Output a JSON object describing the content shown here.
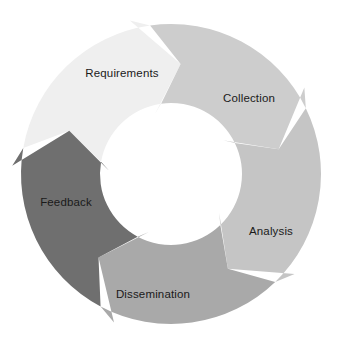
{
  "diagram": {
    "type": "cycle",
    "direction": "clockwise",
    "background_color": "#ffffff",
    "label_color": "#1a1a1a",
    "geometry": {
      "center_x": 171,
      "center_y": 174,
      "outer_radius": 150,
      "inner_radius": 71
    },
    "segments": [
      {
        "id": "requirements",
        "label": "Requirements",
        "color": "#efefef",
        "start_angle": -80,
        "end_angle": -8,
        "label_x": 122,
        "label_y": 74,
        "anchor": "middle"
      },
      {
        "id": "collection",
        "label": "Collection",
        "color": "#cdcdcd",
        "start_angle": -8,
        "end_angle": 64,
        "label_x": 249,
        "label_y": 99,
        "anchor": "middle"
      },
      {
        "id": "analysis",
        "label": "Analysis",
        "color": "#c5c5c5",
        "start_angle": 64,
        "end_angle": 136,
        "label_x": 271,
        "label_y": 232,
        "anchor": "middle"
      },
      {
        "id": "dissemination",
        "label": "Dissemination",
        "color": "#a9a9a9",
        "start_angle": 136,
        "end_angle": 208,
        "label_x": 153,
        "label_y": 295,
        "anchor": "middle"
      },
      {
        "id": "feedback",
        "label": "Feedback",
        "color": "#6f6f6f",
        "start_angle": 208,
        "end_angle": 280,
        "label_x": 66,
        "label_y": 203,
        "anchor": "middle"
      }
    ]
  }
}
